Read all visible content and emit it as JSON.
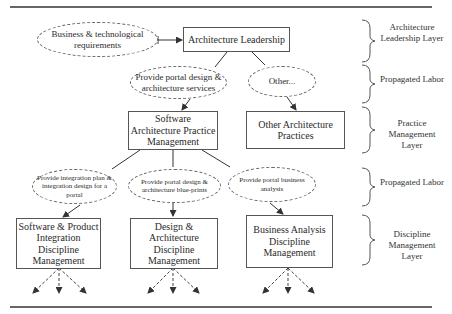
{
  "diagram": {
    "nodes": {
      "requirements": "Business & technological requirements",
      "leadership": "Architecture Leadership",
      "portal_services": "Provide portal design & architecture services",
      "other": "Other...",
      "sw_arch_practice": "Software Architecture Practice Management",
      "other_practices": "Other Architecture Practices",
      "integration_plan": "Provide integration plan & integration design for a portal",
      "blueprints": "Provide portal design & architecture blue-prints",
      "business_analysis_task": "Provide portal business analysis",
      "sw_product_integration": "Software & Product Integration Discipline Management",
      "design_arch": "Design & Architecture Discipline Management",
      "business_analysis": "Business Analysis Discipline Management"
    },
    "layers": [
      "Architecture Leadership Layer",
      "Propagated Labor",
      "Practice Management Layer",
      "Propagated Labor",
      "Discipline Management Layer"
    ]
  }
}
